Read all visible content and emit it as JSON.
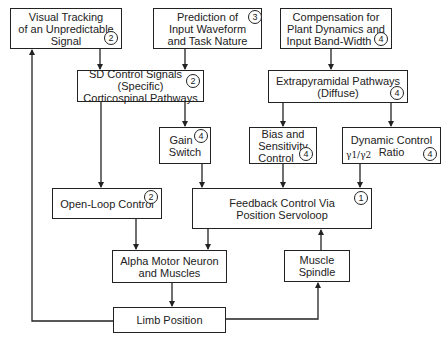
{
  "diagram": {
    "nodes": {
      "visual_tracking": {
        "lines": [
          "Visual Tracking",
          "of an Unpredictable",
          "Signal"
        ],
        "badge": "2"
      },
      "prediction": {
        "lines": [
          "Prediction of",
          "Input Waveform",
          "and Task Nature"
        ],
        "badge": "3"
      },
      "compensation": {
        "lines": [
          "Compensation for",
          "Plant Dynamics and",
          "Input Band-Width"
        ],
        "badge": "4"
      },
      "sd_control": {
        "lines": [
          "SD Control Signals",
          "(Specific)",
          "Corticospinal Pathways"
        ],
        "badge": "2"
      },
      "extrapyramidal": {
        "lines": [
          "Extrapyramidal Pathways",
          "(Diffuse)"
        ],
        "badge": "4"
      },
      "gain_switch": {
        "lines": [
          "Gain",
          "Switch"
        ],
        "badge": "4"
      },
      "bias_sensitivity": {
        "lines": [
          "Bias and",
          "Sensitivity",
          "Control"
        ],
        "badge": "4"
      },
      "dynamic_control": {
        "lines": [
          "Dynamic Control",
          "Ratio"
        ],
        "badge": "4",
        "subscript": "γ1/γ2"
      },
      "open_loop": {
        "lines": [
          "Open-Loop Control"
        ],
        "badge": "2"
      },
      "feedback": {
        "lines": [
          "Feedback Control Via",
          "Position Servoloop"
        ],
        "badge": "1"
      },
      "alpha_motor": {
        "lines": [
          "Alpha Motor Neuron",
          "and Muscles"
        ]
      },
      "muscle_spindle": {
        "lines": [
          "Muscle",
          "Spindle"
        ]
      },
      "limb_position": {
        "lines": [
          "Limb Position"
        ]
      }
    },
    "edges": [
      [
        "visual_tracking",
        "sd_control"
      ],
      [
        "prediction",
        "sd_control"
      ],
      [
        "compensation",
        "extrapyramidal"
      ],
      [
        "sd_control",
        "open_loop"
      ],
      [
        "sd_control",
        "gain_switch"
      ],
      [
        "extrapyramidal",
        "bias_sensitivity"
      ],
      [
        "extrapyramidal",
        "dynamic_control"
      ],
      [
        "gain_switch",
        "feedback"
      ],
      [
        "bias_sensitivity",
        "feedback"
      ],
      [
        "dynamic_control",
        "feedback"
      ],
      [
        "open_loop",
        "alpha_motor"
      ],
      [
        "feedback",
        "alpha_motor"
      ],
      [
        "alpha_motor",
        "limb_position"
      ],
      [
        "limb_position",
        "muscle_spindle"
      ],
      [
        "muscle_spindle",
        "feedback"
      ],
      [
        "limb_position",
        "visual_tracking"
      ]
    ]
  }
}
